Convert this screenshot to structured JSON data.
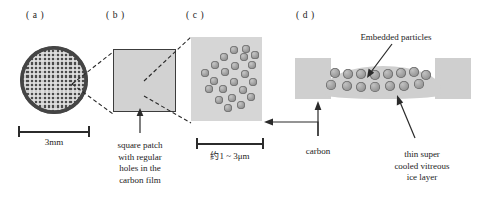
{
  "figure": {
    "panels": [
      {
        "letter": "( a )"
      },
      {
        "letter": "( b )"
      },
      {
        "letter": "( c )"
      },
      {
        "letter": "( d )"
      }
    ]
  },
  "scalebars": [
    {
      "name": "grid-scale",
      "label": "3mm"
    },
    {
      "name": "particle-scale",
      "label": "约1 ~ 3μm"
    }
  ],
  "captions": {
    "square_patch": "square patch\nwith regular\nholes in the\ncarbon film",
    "carbon": "carbon",
    "embedded_particles": "Embedded particles",
    "ice_layer": "thin super\ncooled vitreous\nice layer"
  },
  "colors": {
    "grid_disc": "#4a4a4a",
    "patch_fill": "#d2d2d2",
    "patch_border": "#3c3c3c",
    "field_fill": "#d6d6d6",
    "particle": "#9a9a9a",
    "carbon_block": "#cfcfcf",
    "ice_layer": "#cfcfcf",
    "leader_line": "#2a2a2a",
    "background": "#ffffff"
  },
  "chart_data": {
    "type": "diagram",
    "panels": [
      {
        "id": "a",
        "label": "( a )",
        "description": "circular EM grid with regular square mesh",
        "scale": "3mm"
      },
      {
        "id": "b",
        "label": "( b )",
        "description": "square patch with regular holes in the carbon film",
        "annotation": "square patch with regular holes in the carbon film"
      },
      {
        "id": "c",
        "label": "( c )",
        "description": "hole filled with vitreous ice containing particles",
        "scale": "约1 ~ 3μm",
        "particle_count": 22
      },
      {
        "id": "d",
        "label": "( d )",
        "description": "cross-section of hole showing thin vitreous ice layer with embedded particles between carbon edges",
        "annotations": [
          "Embedded particles",
          "carbon",
          "thin super cooled vitreous ice layer"
        ],
        "particle_count": 15
      }
    ],
    "particles_c": [
      {
        "x": 14,
        "y": 36,
        "r": 4.0
      },
      {
        "x": 24,
        "y": 28,
        "r": 4.0
      },
      {
        "x": 23,
        "y": 44,
        "r": 4.0
      },
      {
        "x": 33,
        "y": 20,
        "r": 4.0
      },
      {
        "x": 34,
        "y": 35,
        "r": 4.3
      },
      {
        "x": 32,
        "y": 52,
        "r": 4.0
      },
      {
        "x": 43,
        "y": 13,
        "r": 4.2
      },
      {
        "x": 44,
        "y": 29,
        "r": 4.0
      },
      {
        "x": 43,
        "y": 45,
        "r": 4.3
      },
      {
        "x": 41,
        "y": 61,
        "r": 4.0
      },
      {
        "x": 53,
        "y": 20,
        "r": 4.2
      },
      {
        "x": 54,
        "y": 37,
        "r": 4.2
      },
      {
        "x": 52,
        "y": 53,
        "r": 4.0
      },
      {
        "x": 50,
        "y": 68,
        "r": 4.0
      },
      {
        "x": 61,
        "y": 28,
        "r": 4.0
      },
      {
        "x": 62,
        "y": 45,
        "r": 4.2
      },
      {
        "x": 60,
        "y": 60,
        "r": 4.0
      },
      {
        "x": 18,
        "y": 52,
        "r": 4.0
      },
      {
        "x": 28,
        "y": 63,
        "r": 4.0
      },
      {
        "x": 37,
        "y": 71,
        "r": 4.0
      },
      {
        "x": 55,
        "y": 12,
        "r": 3.8
      },
      {
        "x": 64,
        "y": 18,
        "r": 3.6
      }
    ],
    "particles_d": [
      {
        "x": 40,
        "y": 15,
        "r": 5.0
      },
      {
        "x": 53,
        "y": 16,
        "r": 5.0
      },
      {
        "x": 66,
        "y": 16,
        "r": 5.4
      },
      {
        "x": 80,
        "y": 17,
        "r": 5.0
      },
      {
        "x": 93,
        "y": 16,
        "r": 5.2
      },
      {
        "x": 106,
        "y": 15,
        "r": 5.0
      },
      {
        "x": 119,
        "y": 14,
        "r": 5.0
      },
      {
        "x": 131,
        "y": 17,
        "r": 5.2
      },
      {
        "x": 36,
        "y": 27,
        "r": 4.8
      },
      {
        "x": 52,
        "y": 28,
        "r": 5.0
      },
      {
        "x": 66,
        "y": 29,
        "r": 5.0
      },
      {
        "x": 80,
        "y": 29,
        "r": 4.8
      },
      {
        "x": 95,
        "y": 28,
        "r": 5.0
      },
      {
        "x": 109,
        "y": 28,
        "r": 5.0
      },
      {
        "x": 124,
        "y": 26,
        "r": 4.8
      }
    ]
  }
}
